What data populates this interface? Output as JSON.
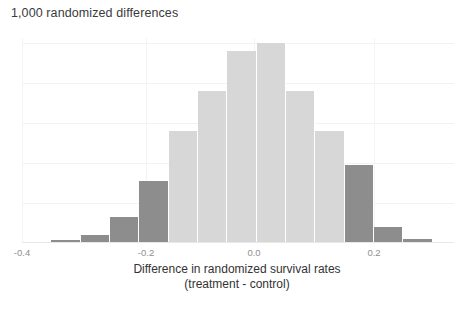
{
  "chart_data": {
    "type": "bar",
    "title": "1,000 randomized differences",
    "subtitle": "",
    "xlabel": "Difference in randomized survival rates",
    "xlabel_line2": "(treatment - control)",
    "ylabel": "",
    "xlim": [
      -0.42,
      0.3
    ],
    "ylim": [
      0,
      205
    ],
    "grid": true,
    "legend_position": "none",
    "bin_width": 0.05,
    "tick_labels": [
      "-0.4",
      "-0.2",
      "0.0",
      "0.2"
    ],
    "tick_values": [
      -0.4,
      -0.2,
      0.0,
      0.2
    ],
    "colors": {
      "tail": "#8d8d8d",
      "center": "#d7d7d7",
      "background": "#ffffff",
      "gridline": "#f2f2f2",
      "text": "#333333",
      "tick_text": "#8f8f8f"
    },
    "categories": [
      "-0.325",
      "-0.275",
      "-0.225",
      "-0.175",
      "-0.125",
      "-0.075",
      "-0.025",
      "0.025",
      "0.075",
      "0.125",
      "0.175",
      "0.225",
      "0.275"
    ],
    "bin_starts": [
      -0.35,
      -0.3,
      -0.25,
      -0.2,
      -0.15,
      -0.1,
      -0.05,
      0.0,
      0.05,
      0.1,
      0.15,
      0.2,
      0.25
    ],
    "values": [
      3,
      8,
      26,
      62,
      112,
      152,
      192,
      200,
      152,
      112,
      78,
      16,
      4
    ],
    "bar_groups": [
      "tail",
      "tail",
      "tail",
      "tail",
      "center",
      "center",
      "center",
      "center",
      "center",
      "center",
      "tail",
      "tail",
      "tail"
    ]
  },
  "axis": {
    "x_tick_0": "-0.4",
    "x_tick_1": "-0.2",
    "x_tick_2": "0.0",
    "x_tick_3": "0.2"
  }
}
